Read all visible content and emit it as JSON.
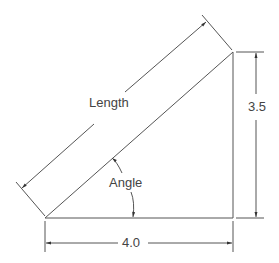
{
  "diagram": {
    "type": "dimensioned right triangle",
    "labels": {
      "hypotenuse": "Length",
      "angle": "Angle",
      "height": "3.5",
      "base": "4.0"
    },
    "values": {
      "base": 4.0,
      "height": 3.5
    },
    "colors": {
      "line": "#555555",
      "text": "#444444",
      "background": "#ffffff"
    }
  }
}
